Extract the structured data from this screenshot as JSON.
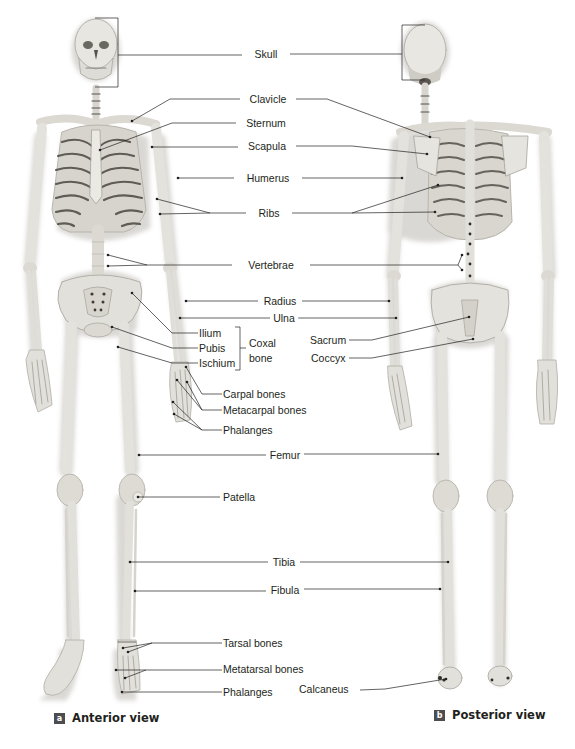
{
  "views": [
    {
      "badge": "a",
      "title": "Anterior view"
    },
    {
      "badge": "b",
      "title": "Posterior view"
    }
  ],
  "labels": {
    "skull": "Skull",
    "clavicle": "Clavicle",
    "sternum": "Sternum",
    "scapula": "Scapula",
    "humerus": "Humerus",
    "ribs": "Ribs",
    "vertebrae": "Vertebrae",
    "radius": "Radius",
    "ulna": "Ulna",
    "ilium": "Ilium",
    "pubis": "Pubis",
    "ischium": "Ischium",
    "coxal_bone_line1": "Coxal",
    "coxal_bone_line2": "bone",
    "sacrum": "Sacrum",
    "coccyx": "Coccyx",
    "carpal_bones": "Carpal bones",
    "metacarpal_bones": "Metacarpal bones",
    "hand_phalanges": "Phalanges",
    "femur": "Femur",
    "patella": "Patella",
    "tibia": "Tibia",
    "fibula": "Fibula",
    "tarsal_bones": "Tarsal bones",
    "metatarsal_bones": "Metatarsal bones",
    "foot_phalanges": "Phalanges",
    "calcaneus": "Calcaneus"
  },
  "colors": {
    "bone": "#e6e4df",
    "bone_shadow": "#c9c6c0",
    "leader_line": "#231f20",
    "badge": "#4d4d4f"
  }
}
